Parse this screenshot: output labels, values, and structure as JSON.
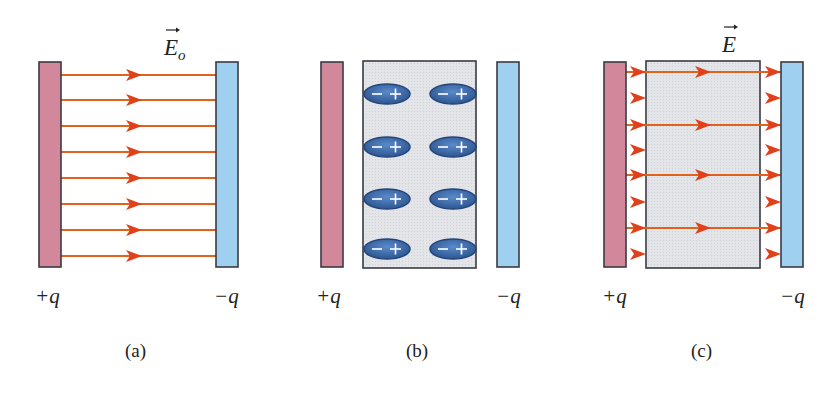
{
  "colors": {
    "positive_plate": "#d2879a",
    "negative_plate": "#9fd0ef",
    "plate_border": "#3a3a44",
    "field_line": "#e2621b",
    "arrowhead": "#e0401a",
    "dielectric": "#e1e3e6",
    "dipole_fill": "#3f6fb0",
    "dipole_dark": "#23447a"
  },
  "panels": [
    {
      "id": "a",
      "caption": "(a)",
      "field_label": "E",
      "field_subscript": "o",
      "left_charge": "+q",
      "right_charge": "−q",
      "has_dielectric": false,
      "field_lines": 8
    },
    {
      "id": "b",
      "caption": "(b)",
      "left_charge": "+q",
      "right_charge": "−q",
      "has_dielectric": true,
      "dipole_rows": 4,
      "dipole_cols": 2,
      "dipole_signs": [
        "−",
        "+"
      ]
    },
    {
      "id": "c",
      "caption": "(c)",
      "field_label": "E",
      "left_charge": "+q",
      "right_charge": "−q",
      "has_dielectric": true,
      "field_lines_outside": 8,
      "field_lines_through": 4
    }
  ]
}
